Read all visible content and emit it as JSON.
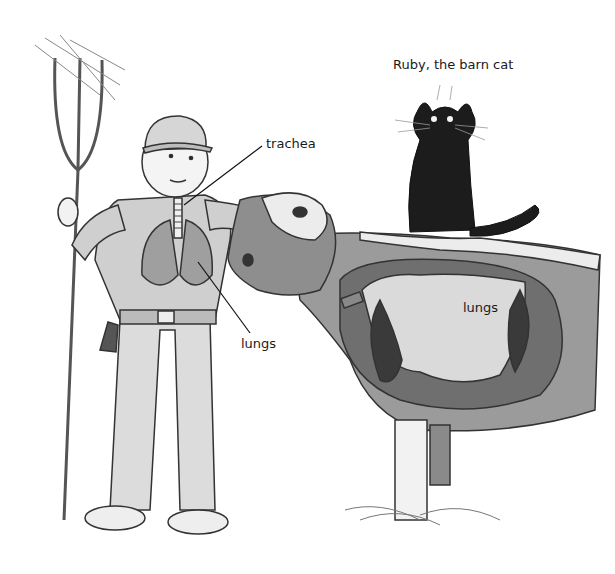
{
  "illustration": {
    "subject": "Farmer and cow showing lungs and trachea, with barn cat",
    "style": "grayscale pencil drawing",
    "labels": {
      "cat": "Ruby, the barn cat",
      "trachea": "trachea",
      "lungs_farmer": "lungs",
      "lungs_cow": "lungs"
    },
    "colors": {
      "background": "#ffffff",
      "ink": "#1a1a1a",
      "shade_light": "#d9d9d9",
      "shade_mid": "#9a9a9a",
      "shade_dark": "#555555",
      "cat": "#1c1c1c"
    }
  }
}
